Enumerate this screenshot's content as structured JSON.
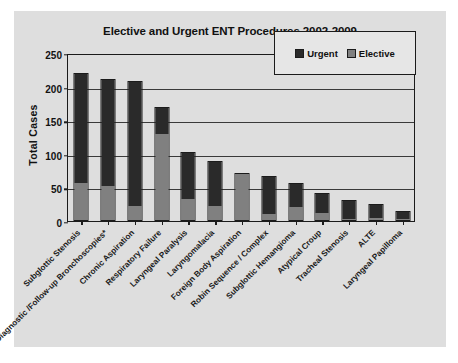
{
  "chart_data": {
    "type": "bar",
    "title": "Elective and Urgent ENT Procedures 2002-2009",
    "xlabel": "",
    "ylabel": "Total Cases",
    "ylim": [
      0,
      250
    ],
    "yticks": [
      0,
      50,
      100,
      150,
      200,
      250
    ],
    "grid": true,
    "stacked": true,
    "legend_position": "top-right",
    "categories": [
      "Subglottic Stenosis",
      "Diagnostic /Follow-up Bronchoscopies*",
      "Chronic Aspiration",
      "Respiratory Failure",
      "Laryngeal Paralysis",
      "Laryngomalacia",
      "Foreign Body Aspiration",
      "Robin Sequence / Complex",
      "Subglottic Hemangioma",
      "Atypical Croup",
      "Tracheal Stenosis",
      "ALTE",
      "Laryngeal Papilloma"
    ],
    "series": [
      {
        "name": "Elective",
        "color": "#808080",
        "values": [
          55,
          50,
          21,
          128,
          32,
          21,
          69,
          9,
          20,
          10,
          2,
          3,
          2
        ]
      },
      {
        "name": "Urgent",
        "color": "#2a2a2a",
        "values": [
          163,
          158,
          184,
          38,
          68,
          66,
          0,
          55,
          33,
          29,
          26,
          20,
          10
        ]
      }
    ],
    "totals": [
      218,
      208,
      205,
      166,
      100,
      87,
      69,
      64,
      53,
      39,
      28,
      23,
      12
    ]
  },
  "legend": {
    "items": [
      {
        "label": "Urgent",
        "color": "#2a2a2a"
      },
      {
        "label": "Elective",
        "color": "#808080"
      }
    ]
  }
}
